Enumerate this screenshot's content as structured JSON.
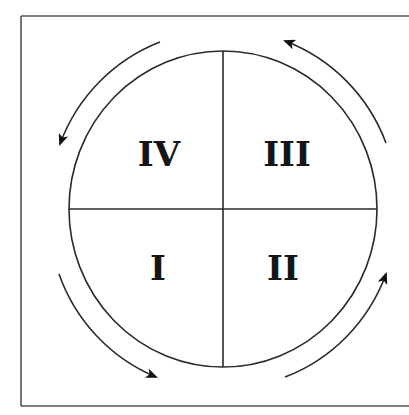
{
  "diagram": {
    "type": "quadrant-cycle",
    "colors": {
      "stroke": "#2a2a2a",
      "frame": "#555555",
      "background": "#ffffff",
      "text": "#151515"
    },
    "quadrants": [
      {
        "id": "top-left",
        "label": "IV"
      },
      {
        "id": "top-right",
        "label": "III"
      },
      {
        "id": "bottom-left",
        "label": "I"
      },
      {
        "id": "bottom-right",
        "label": "II"
      }
    ],
    "arrows": [
      {
        "position": "top-left",
        "direction": "counterclockwise"
      },
      {
        "position": "top-right",
        "direction": "counterclockwise"
      },
      {
        "position": "bottom-left",
        "direction": "counterclockwise"
      },
      {
        "position": "bottom-right",
        "direction": "counterclockwise"
      }
    ]
  }
}
